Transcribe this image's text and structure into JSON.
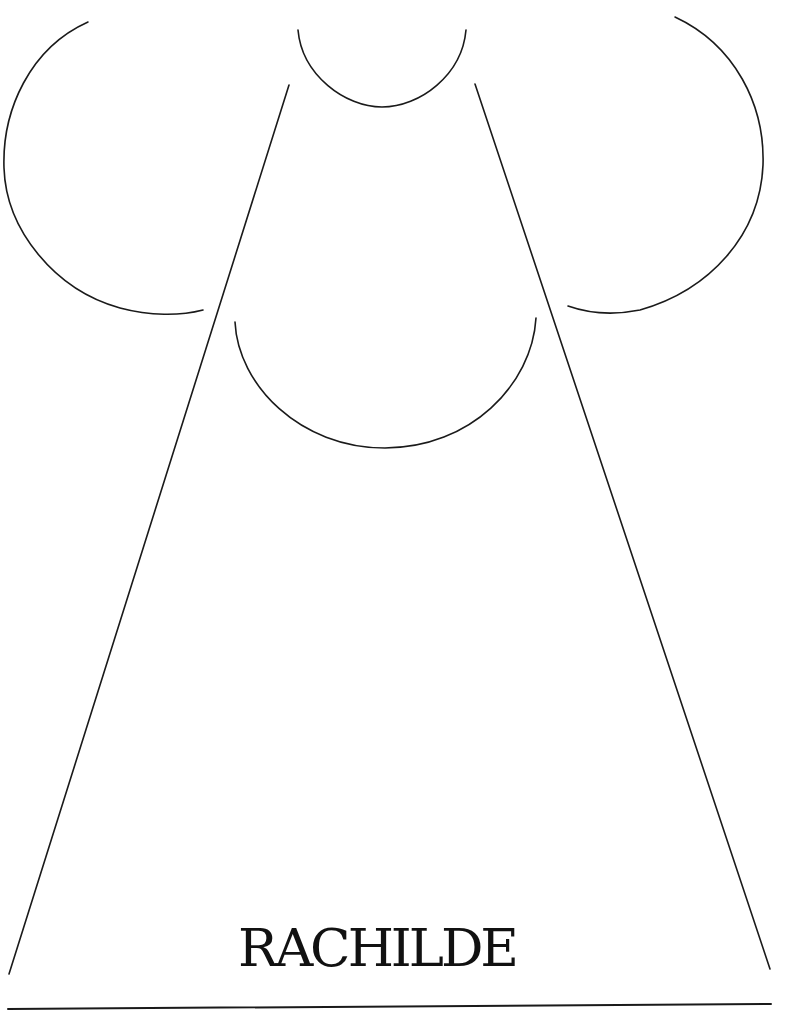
{
  "title": {
    "text": "RACHILDE"
  },
  "colors": {
    "stroke": "#1a1a1a",
    "background": "#ffffff",
    "text": "#111111"
  },
  "shapes": {
    "left_arc": "open arc, left side, facing right",
    "top_arc": "small open arc, top center, opening upward",
    "right_arc": "open arc, right side, facing left",
    "middle_arc": "large open arc, center, opening upward",
    "left_line": "long diagonal line from top-center-left to bottom-left",
    "right_line": "long diagonal line from top-center-right to bottom-right",
    "baseline": "horizontal rule along the bottom"
  }
}
